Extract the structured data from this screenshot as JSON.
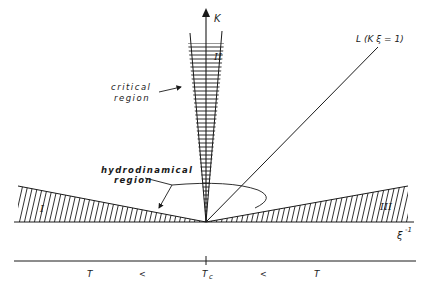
{
  "diagram": {
    "axes": {
      "vertical_label": "K",
      "horizontal_label": "ξ",
      "horizontal_label_sup": "-1"
    },
    "line_L": {
      "label": "L (K ξ = 1)"
    },
    "regions": {
      "I": "I",
      "II": "II",
      "III": "III"
    },
    "annotations": {
      "critical_line1": "critical",
      "critical_line2": "region",
      "hydro_line1": "hydrodinamical",
      "hydro_line2": "region"
    },
    "temperature_axis": {
      "labels": [
        "T",
        "<",
        "T",
        "<",
        "T"
      ],
      "center_sub": "c"
    },
    "colors": {
      "ink": "#1a1a1a",
      "background": "#ffffff"
    }
  }
}
